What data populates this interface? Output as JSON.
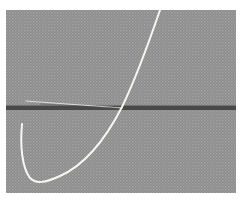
{
  "image": {
    "subject": "needle and thread on gray woven fabric",
    "colors": {
      "background": "#ffffff",
      "fabric": "#8c8c8c",
      "fabric_light": "#a6a6a6",
      "seam": "#3a3a3a",
      "thread": "#f5f5f0",
      "needle": "#d8d8d8"
    }
  }
}
